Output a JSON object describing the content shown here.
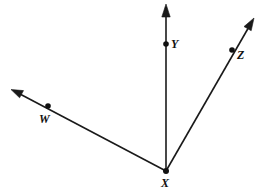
{
  "figure": {
    "kind": "geometry-ray-diagram",
    "width": 265,
    "height": 195,
    "background_color": "#ffffff",
    "line_color": "#1a1a1a",
    "point_color": "#111111"
  },
  "vertex": {
    "name": "X",
    "label": "X",
    "x": 166,
    "y": 171
  },
  "points": [
    {
      "name": "Y",
      "label": "Y",
      "x": 166,
      "y": 44
    },
    {
      "name": "Z",
      "label": "Z",
      "x": 232,
      "y": 50
    },
    {
      "name": "W",
      "label": "W",
      "x": 48,
      "y": 106
    }
  ],
  "rays": [
    {
      "name": "ray-XY",
      "label": "XY",
      "from": "X",
      "through": "Y",
      "start_x": 166,
      "start_y": 171,
      "end_x": 166,
      "end_y": 5,
      "arrow": "end"
    },
    {
      "name": "ray-XZ",
      "label": "XZ",
      "from": "X",
      "through": "Z",
      "start_x": 166,
      "start_y": 171,
      "end_x": 254,
      "end_y": 18,
      "arrow": "end"
    },
    {
      "name": "ray-XW",
      "label": "XW",
      "from": "X",
      "through": "W",
      "start_x": 166,
      "start_y": 171,
      "end_x": 12,
      "end_y": 90,
      "arrow": "end"
    }
  ]
}
